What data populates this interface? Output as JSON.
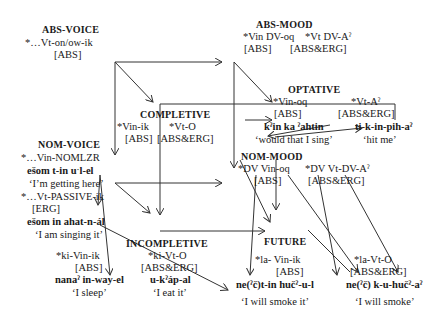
{
  "nodes": {
    "abs_voice": {
      "heading": "ABS-VOICE",
      "form": "*…Vt-on/ow-ik",
      "case": "[ABS]"
    },
    "abs_mood": {
      "heading": "ABS-MOOD",
      "form_intr": "*Vin DV-oq",
      "form_tr": "*Vt DV-Aˀ",
      "case_intr": "[ABS]",
      "case_tr": "[ABS&ERG]"
    },
    "optative": {
      "heading": "OPTATIVE",
      "form_intr": "*Vin-oq",
      "form_tr": "*Vt-Aˀ",
      "case_intr": "[ABS]",
      "case_tr": "[ABS&ERG]",
      "example_intr": "kˀin ka ˀahtin",
      "gloss_intr": "‘would that I sing’",
      "example_tr": "ti-k-in-pih-aˀ",
      "gloss_tr": "‘hit me’"
    },
    "completive": {
      "heading": "COMPLETIVE",
      "form_intr": "*Vin-ik",
      "form_tr": "*Vt-O",
      "case_intr": "[ABS]",
      "case_tr": "[ABS&ERG]"
    },
    "nom_voice": {
      "heading": "NOM-VOICE",
      "form_intr": "*…Vin-NOMLZR",
      "example_intr": "ešom t-in uˑl-el",
      "gloss_intr": "‘I’m getting here’",
      "form_tr": "*…Vt-PASSIVE-ik",
      "case_tr": "[ERG]",
      "example_tr": "ešom in ahat-n-ál",
      "gloss_tr": "‘I am singing it’"
    },
    "nom_mood": {
      "heading": "NOM-MOOD",
      "form_intr": "*DV Vin-oq",
      "form_tr": "*DV Vt-DV-Aˀ",
      "case_intr": "[ABS]",
      "case_tr": "[ABS&ERG]"
    },
    "incompletive_intr": {
      "form": "*ki-Vin-ik",
      "case": "[ABS]",
      "example": "nanaˀ in-way-el",
      "gloss": "‘I sleep’"
    },
    "incompletive": {
      "heading": "INCOMPLETIVE",
      "form": "*ki-Vt-O",
      "case": "[ABS&ERG]",
      "example": "u-kˀáp-al",
      "gloss": "‘I eat it’"
    },
    "future": {
      "heading": "FUTURE",
      "form_intr": "*la- Vin-ik",
      "case_intr": "[ABS]",
      "example_intr": "ne(ˀč)t-in hučˀ-u-l",
      "gloss_intr": "‘I will smoke it’",
      "form_tr": "*la-Vt-O",
      "case_tr": "[ABS&ERG]",
      "example_tr": "ne(ˀč) k-u-hučˀ-aˀ",
      "gloss_tr": "‘I will smoke’"
    }
  }
}
